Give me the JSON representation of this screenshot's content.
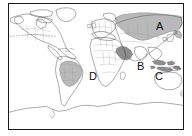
{
  "figure": {
    "type": "world-map-outline",
    "projection": "equirectangular",
    "frame": {
      "stroke_color": "#1a1a1a",
      "fill_color": "#ffffff",
      "border_width_px": 1
    },
    "style": {
      "coastline_color": "#555555",
      "country_border_color": "#8a8a8a",
      "highlight_fill_light": "#b9b9b9",
      "highlight_fill_dark": "#8e8e8e",
      "background_color": "#ffffff",
      "label_color": "#0d0d0d"
    }
  },
  "labels": [
    {
      "id": "A",
      "text": "A",
      "region": "russia-siberia-north-asia",
      "x": 147,
      "y": 17
    },
    {
      "id": "B",
      "text": "B",
      "region": "arabian-peninsula-east-africa",
      "x": 128,
      "y": 57
    },
    {
      "id": "C",
      "text": "C",
      "region": "indonesia-southeast-asia",
      "x": 146,
      "y": 67
    },
    {
      "id": "D",
      "text": "D",
      "region": "brazil-south-america",
      "x": 80,
      "y": 67
    }
  ],
  "highlighted_regions": [
    {
      "label": "A",
      "name": "Russia",
      "shade": "light"
    },
    {
      "label": "B",
      "name": "Saudi Arabia",
      "shade": "dark"
    },
    {
      "label": "C",
      "name": "Indonesia",
      "shade": "dark"
    },
    {
      "label": "D",
      "name": "Brazil",
      "shade": "light"
    }
  ],
  "map_features": {
    "dashed_border": "usa-canada-border",
    "antarctica_coastline": true,
    "graticule": false
  }
}
